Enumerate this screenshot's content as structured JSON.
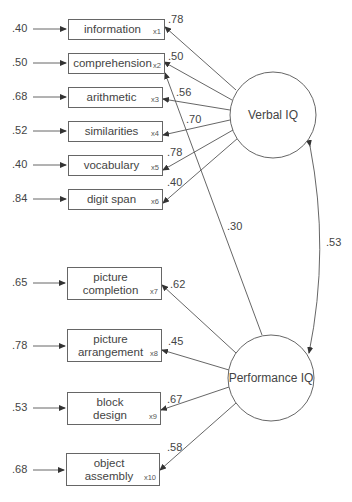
{
  "diagram": {
    "type": "structural-equation-model",
    "factors": [
      {
        "id": "verbal",
        "label": "Verbal IQ"
      },
      {
        "id": "performance",
        "label": "Performance IQ"
      }
    ],
    "indicators": [
      {
        "id": "x1",
        "label": "information",
        "sub": "x1",
        "error": ".40",
        "loading": ".78",
        "factor": "verbal"
      },
      {
        "id": "x2",
        "label": "comprehension",
        "sub": "x2",
        "error": ".50",
        "loading": ".50",
        "factor": "verbal"
      },
      {
        "id": "x3",
        "label": "arithmetic",
        "sub": "x3",
        "error": ".68",
        "loading": ".56",
        "factor": "verbal"
      },
      {
        "id": "x4",
        "label": "similarities",
        "sub": "x4",
        "error": ".52",
        "loading": ".70",
        "factor": "verbal"
      },
      {
        "id": "x5",
        "label": "vocabulary",
        "sub": "x5",
        "error": ".40",
        "loading": ".78",
        "factor": "verbal"
      },
      {
        "id": "x6",
        "label": "digit span",
        "sub": "x6",
        "error": ".84",
        "loading": ".40",
        "factor": "verbal"
      },
      {
        "id": "x7",
        "label1": "picture",
        "label2": "completion",
        "sub": "x7",
        "error": ".65",
        "loading": ".62",
        "factor": "performance"
      },
      {
        "id": "x8",
        "label1": "picture",
        "label2": "arrangement",
        "sub": "x8",
        "error": ".78",
        "loading": ".45",
        "factor": "performance"
      },
      {
        "id": "x9",
        "label1": "block",
        "label2": "design",
        "sub": "x9",
        "error": ".53",
        "loading": ".67",
        "factor": "performance"
      },
      {
        "id": "x10",
        "label1": "object",
        "label2": "assembly",
        "sub": "x10",
        "error": ".68",
        "loading": ".58",
        "factor": "performance"
      }
    ],
    "cross_loading": {
      "from": "performance",
      "to": "x2",
      "value": ".30"
    },
    "factor_covariance": {
      "between": [
        "verbal",
        "performance"
      ],
      "value": ".53"
    }
  }
}
